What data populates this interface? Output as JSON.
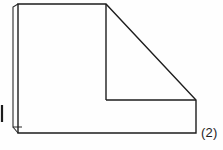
{
  "figure": {
    "label": "(2)",
    "caption_text": "(2)",
    "kind": "technical-line-drawing",
    "canvas": {
      "width": 223,
      "height": 150
    },
    "colors": {
      "background": "#fefefe",
      "stroke": "#1d1d1d",
      "label_text": "#1d1d1d"
    },
    "stroke": {
      "width": 1.4,
      "sliver_width": 1.1,
      "tick_width": 2.2
    },
    "geometry": {
      "outer_outline_points": "18,4 106,4 196,100 196,133 18,133",
      "inner_vertical": {
        "x1": 106,
        "y1": 4,
        "x2": 106,
        "y2": 100
      },
      "inner_horizontal": {
        "x1": 106,
        "y1": 100,
        "x2": 196,
        "y2": 100
      },
      "left_sliver": {
        "x1": 13,
        "y1": 7,
        "x2": 13,
        "y2": 127
      },
      "left_sliver_top_join": {
        "x1": 13,
        "y1": 7,
        "x2": 18,
        "y2": 4
      },
      "left_sliver_bottom_join": {
        "x1": 13,
        "y1": 127,
        "x2": 18,
        "y2": 133
      },
      "left_sliver_foot": {
        "x1": 13,
        "y1": 127,
        "x2": 22,
        "y2": 127
      },
      "edge_tick": {
        "x1": 2,
        "y1": 105,
        "x2": 2,
        "y2": 122
      },
      "chamfer_diagonal": {
        "x1": 106,
        "y1": 4,
        "x2": 196,
        "y2": 100
      }
    }
  }
}
